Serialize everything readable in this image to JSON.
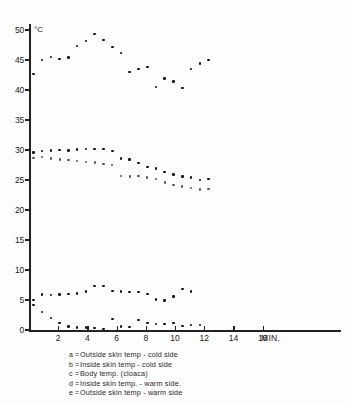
{
  "figure": {
    "unit_label": "°C",
    "x_axis_title": "MIN."
  },
  "axes": {
    "y_ticks": [
      0,
      5,
      10,
      15,
      20,
      25,
      30,
      35,
      40,
      45,
      50
    ],
    "x_ticks": [
      2,
      4,
      6,
      8,
      10,
      12,
      14,
      16
    ]
  },
  "legend": {
    "entries": [
      {
        "key": "a",
        "eq": "=",
        "label": "Outside skin temp - cold side"
      },
      {
        "key": "b",
        "eq": "=",
        "label": "Inside skin temp - cold side"
      },
      {
        "key": "c",
        "eq": "=",
        "label": "Body temp. (cloaca)"
      },
      {
        "key": "d",
        "eq": "=",
        "label": "Inside skin temp. - warm side."
      },
      {
        "key": "e",
        "eq": "=",
        "label": "Outside skin temp - warm side"
      }
    ]
  },
  "chart_data": {
    "type": "scatter",
    "title": "",
    "xlabel": "MIN.",
    "ylabel": "°C",
    "xlim": [
      0,
      19
    ],
    "ylim": [
      0,
      51
    ],
    "grid": false,
    "legend_position": "below-plot",
    "x": [
      0.3,
      0.9,
      1.5,
      2.1,
      2.7,
      3.3,
      3.9,
      4.5,
      5.1,
      5.7,
      6.3,
      6.9,
      7.5,
      8.1,
      8.7,
      9.3,
      9.9,
      10.5,
      11.1,
      11.7,
      12.3,
      12.9,
      13.5,
      14.1,
      14.7,
      15.3,
      15.9,
      16.5,
      17.1,
      17.7
    ],
    "series": [
      {
        "name": "a = Outside skin temp - cold side",
        "key": "a",
        "values": [
          42.7,
          45.0,
          45.5,
          45.2,
          45.4,
          47.3,
          48.2,
          49.3,
          48.3,
          47.2,
          46.2,
          43.0,
          43.5,
          43.8,
          40.5,
          41.9,
          41.4,
          40.3,
          43.5,
          44.4,
          45.0,
          null,
          null,
          null,
          null,
          null,
          null,
          null,
          null,
          null
        ]
      },
      {
        "name": "b = Inside skin temp - cold side",
        "key": "b",
        "values": [
          29.6,
          29.8,
          29.9,
          30.0,
          29.9,
          30.1,
          30.2,
          30.2,
          30.2,
          29.8,
          28.6,
          28.4,
          27.8,
          27.2,
          26.9,
          26.3,
          25.9,
          25.6,
          25.4,
          25.0,
          25.2,
          null,
          null,
          null,
          null,
          null,
          null,
          null,
          null,
          null
        ]
      },
      {
        "name": "c = Body temp. (cloaca)",
        "key": "c",
        "values": [
          28.7,
          28.8,
          28.6,
          28.4,
          28.3,
          28.2,
          28.0,
          27.9,
          27.7,
          27.5,
          25.7,
          25.6,
          25.7,
          25.4,
          25.2,
          24.6,
          24.2,
          23.9,
          23.7,
          23.4,
          23.5,
          null,
          null,
          null,
          null,
          null,
          null,
          null,
          null,
          null
        ]
      },
      {
        "name": "d = Inside skin temp. - warm side.",
        "key": "d",
        "values": [
          4.2,
          5.9,
          5.8,
          5.9,
          6.0,
          6.1,
          6.4,
          7.3,
          7.3,
          6.5,
          6.4,
          6.3,
          6.3,
          6.0,
          5.1,
          4.9,
          5.6,
          6.8,
          6.4,
          null,
          null,
          null,
          null,
          null,
          null,
          null,
          null,
          null,
          null,
          null
        ]
      },
      {
        "name": "e = Outside skin temp - warm side",
        "key": "e",
        "values": [
          5.0,
          3.0,
          2.0,
          1.2,
          0.6,
          0.4,
          0.4,
          0.3,
          0.2,
          1.8,
          0.6,
          0.5,
          1.7,
          1.2,
          1.0,
          1.0,
          1.2,
          0.7,
          0.8,
          0.8,
          null,
          null,
          null,
          null,
          null,
          null,
          null,
          null,
          null,
          null
        ]
      }
    ]
  }
}
